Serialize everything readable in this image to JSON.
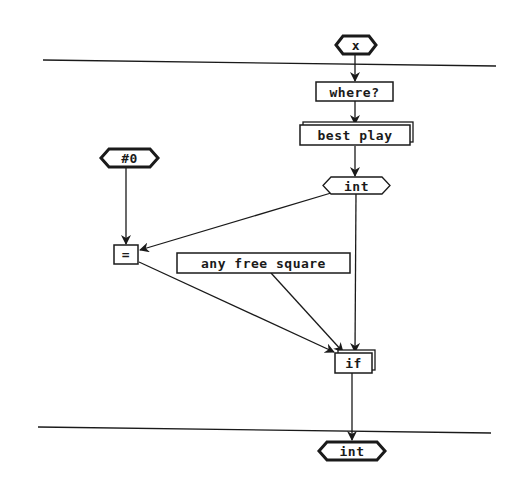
{
  "diagram": {
    "background": "#ffffff",
    "stroke_color": "#1a1a1a",
    "separators": [
      {
        "name": "top-separator",
        "x1": 43,
        "y1": 60,
        "x2": 496,
        "y2": 66
      },
      {
        "name": "bottom-separator",
        "x1": 38,
        "y1": 427,
        "x2": 491,
        "y2": 433
      }
    ],
    "nodes": {
      "input_x": {
        "label": "x",
        "shape": "hexagon",
        "style": "thick"
      },
      "where": {
        "label": "where?",
        "shape": "box"
      },
      "best_play": {
        "label": "best play",
        "shape": "stacked-box"
      },
      "int_mid": {
        "label": "int",
        "shape": "hexagon",
        "style": "thin"
      },
      "const_zero": {
        "label": "#0",
        "shape": "hexagon",
        "style": "thick"
      },
      "equals": {
        "label": "=",
        "shape": "box"
      },
      "any_free": {
        "label": "any free square",
        "shape": "box"
      },
      "if": {
        "label": "if",
        "shape": "stacked-box"
      },
      "output_int": {
        "label": "int",
        "shape": "hexagon",
        "style": "thick"
      }
    },
    "edges": [
      {
        "from": "input_x",
        "to": "where"
      },
      {
        "from": "where",
        "to": "best_play"
      },
      {
        "from": "best_play",
        "to": "int_mid"
      },
      {
        "from": "const_zero",
        "to": "equals"
      },
      {
        "from": "int_mid",
        "to": "equals"
      },
      {
        "from": "equals",
        "to": "if"
      },
      {
        "from": "any_free",
        "to": "if"
      },
      {
        "from": "int_mid",
        "to": "if"
      },
      {
        "from": "if",
        "to": "output_int"
      }
    ]
  }
}
